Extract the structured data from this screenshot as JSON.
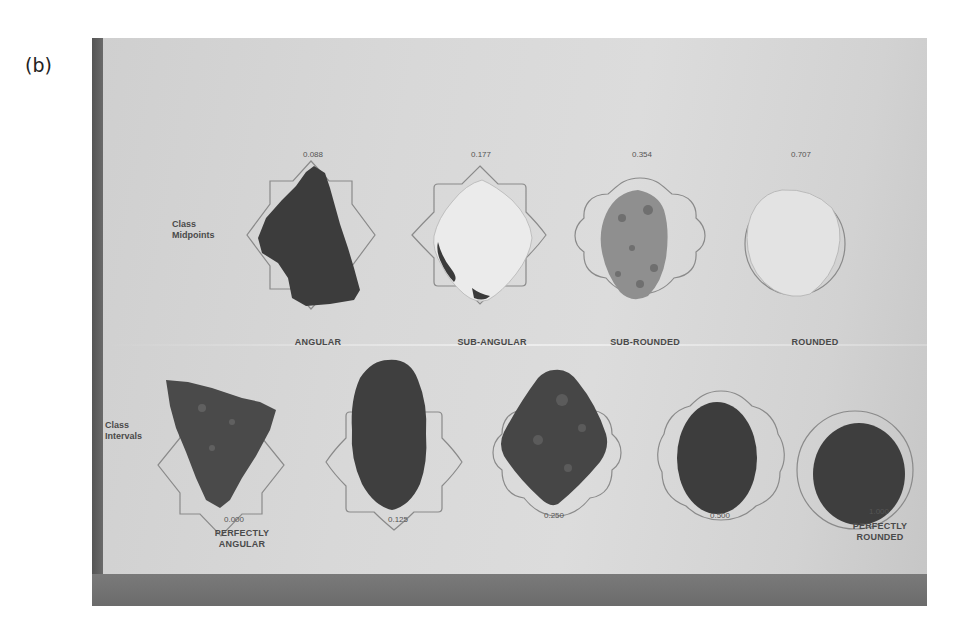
{
  "panel_label": "(b)",
  "figure": {
    "row_labels": {
      "midpoints": [
        "Class",
        "Midpoints"
      ],
      "intervals": [
        "Class",
        "Intervals"
      ]
    },
    "midpoints": [
      {
        "value": "0.088",
        "class": "ANGULAR",
        "tone": "dark"
      },
      {
        "value": "0.177",
        "class": "SUB-ANGULAR",
        "tone": "light"
      },
      {
        "value": "0.354",
        "class": "SUB-ROUNDED",
        "tone": "mottled"
      },
      {
        "value": "0.707",
        "class": "ROUNDED",
        "tone": "light"
      }
    ],
    "intervals": [
      {
        "value": "0.000",
        "caption": [
          "PERFECTLY",
          "ANGULAR"
        ]
      },
      {
        "value": "0.125",
        "caption": []
      },
      {
        "value": "0.250",
        "caption": []
      },
      {
        "value": "0.500",
        "caption": []
      },
      {
        "value": "1.000",
        "caption": [
          "PERFECTLY",
          "ROUNDED"
        ]
      }
    ],
    "colors": {
      "board": "#d6d6d6",
      "edge": "#666666",
      "outline": "#8a8a8a",
      "dark_pebble": "#3c3c3c",
      "light_pebble": "#ececec",
      "mottled_pebble": "#8f8f8f"
    }
  }
}
